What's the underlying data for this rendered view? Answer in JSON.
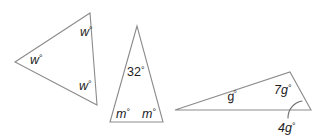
{
  "figure": {
    "background_color": "#ffffff",
    "stroke_color": "#8b8b8b",
    "text_color": "#1c1c1c"
  },
  "triangles": [
    {
      "id": "triangle-left",
      "name": "left-triangle",
      "labels": [
        {
          "id": "w-top",
          "text": "w",
          "degree": "°",
          "italic": true,
          "x": 80,
          "y": 36
        },
        {
          "id": "w-left",
          "text": "w",
          "degree": "°",
          "italic": true,
          "x": 30,
          "y": 64
        },
        {
          "id": "w-bottom",
          "text": "w",
          "degree": "°",
          "italic": true,
          "x": 79,
          "y": 90
        }
      ]
    },
    {
      "id": "triangle-middle",
      "name": "middle-triangle",
      "labels": [
        {
          "id": "apex-32",
          "text": "32",
          "degree": "°",
          "italic": false,
          "x": 127,
          "y": 76
        },
        {
          "id": "m-left",
          "text": "m",
          "degree": "°",
          "italic": true,
          "x": 116,
          "y": 118
        },
        {
          "id": "m-right",
          "text": "m",
          "degree": "°",
          "italic": true,
          "x": 142,
          "y": 118
        }
      ]
    },
    {
      "id": "triangle-right",
      "name": "right-triangle",
      "labels": [
        {
          "id": "g-interior",
          "text": "g",
          "degree": "°",
          "italic": true,
          "x": 228,
          "y": 101
        },
        {
          "id": "seven-g",
          "text": "7g",
          "degree": "°",
          "italic": true,
          "x": 275,
          "y": 94
        },
        {
          "id": "four-g",
          "text": "4g",
          "degree": "°",
          "italic": true,
          "x": 279,
          "y": 131
        }
      ]
    }
  ]
}
